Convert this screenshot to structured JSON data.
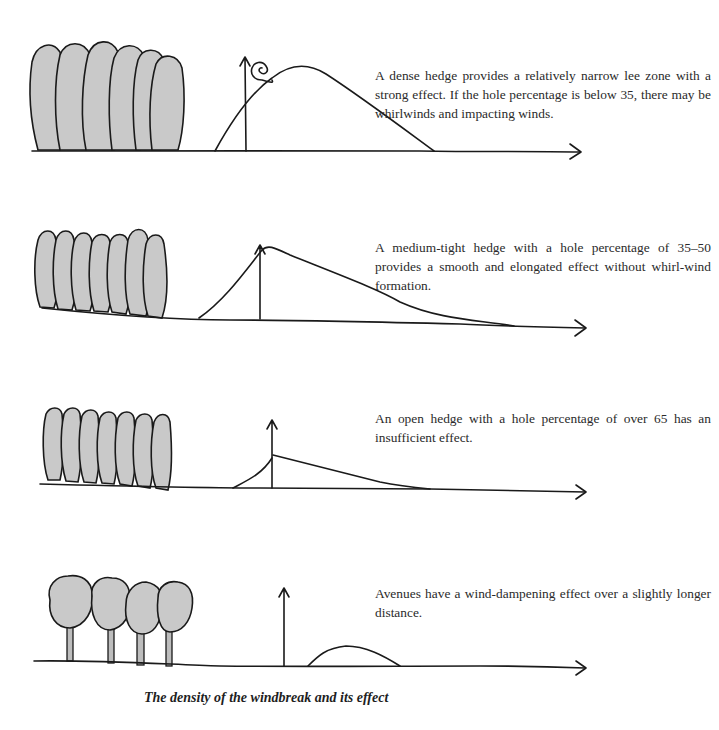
{
  "figure": {
    "title": "The density of the windbreak and its effect"
  },
  "panels": [
    {
      "id": "dense-hedge",
      "hedge_type": "dense hedge",
      "tree_count": 6,
      "description": "A dense hedge provides a relatively narrow lee zone with a strong effect. If the hole percentage is below 35, there may be whirlwinds and impacting winds.",
      "features": [
        "whirlwind-spiral",
        "wind-height-arrow",
        "ground-arrow"
      ]
    },
    {
      "id": "medium-hedge",
      "hedge_type": "medium-tight hedge",
      "tree_count": 7,
      "description": "A medium-tight hedge with a hole percentage of 35–50 provides a smooth and elongated effect without whirl-wind formation.",
      "features": [
        "wind-height-arrow",
        "ground-arrow"
      ]
    },
    {
      "id": "open-hedge",
      "hedge_type": "open hedge",
      "tree_count": 7,
      "description": "An open hedge with a hole percentage of over 65 has an insufficient effect.",
      "features": [
        "wind-height-arrow",
        "ground-arrow"
      ]
    },
    {
      "id": "avenue",
      "hedge_type": "avenue",
      "tree_count": 4,
      "description": "Avenues have a wind-dampening effect over a slightly longer distance.",
      "features": [
        "wind-height-arrow",
        "ground-arrow"
      ]
    }
  ]
}
